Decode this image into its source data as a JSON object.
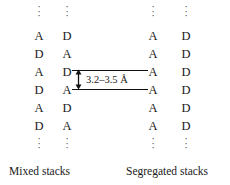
{
  "figure": {
    "background_color": "#ffffff",
    "line_color": "#111111",
    "text_color": "#1a1a1a"
  },
  "columns": [
    {
      "id": "mixed-col-1",
      "x": 28,
      "letters": [
        "A",
        "D",
        "A",
        "D",
        "A",
        "D"
      ]
    },
    {
      "id": "mixed-col-2",
      "x": 56,
      "letters": [
        "D",
        "A",
        "D",
        "A",
        "D",
        "A"
      ]
    },
    {
      "id": "segregated-col-1",
      "x": 142,
      "letters": [
        "A",
        "A",
        "A",
        "A",
        "A",
        "A"
      ]
    },
    {
      "id": "segregated-col-2",
      "x": 175,
      "letters": [
        "D",
        "D",
        "D",
        "D",
        "D",
        "D"
      ]
    }
  ],
  "ellipsis": {
    "glyph": "·",
    "count": 3
  },
  "annotation": {
    "distance_label": "3.2–3.5 Å"
  },
  "captions": {
    "left": "Mixed stacks",
    "right": "Segregated stacks"
  }
}
